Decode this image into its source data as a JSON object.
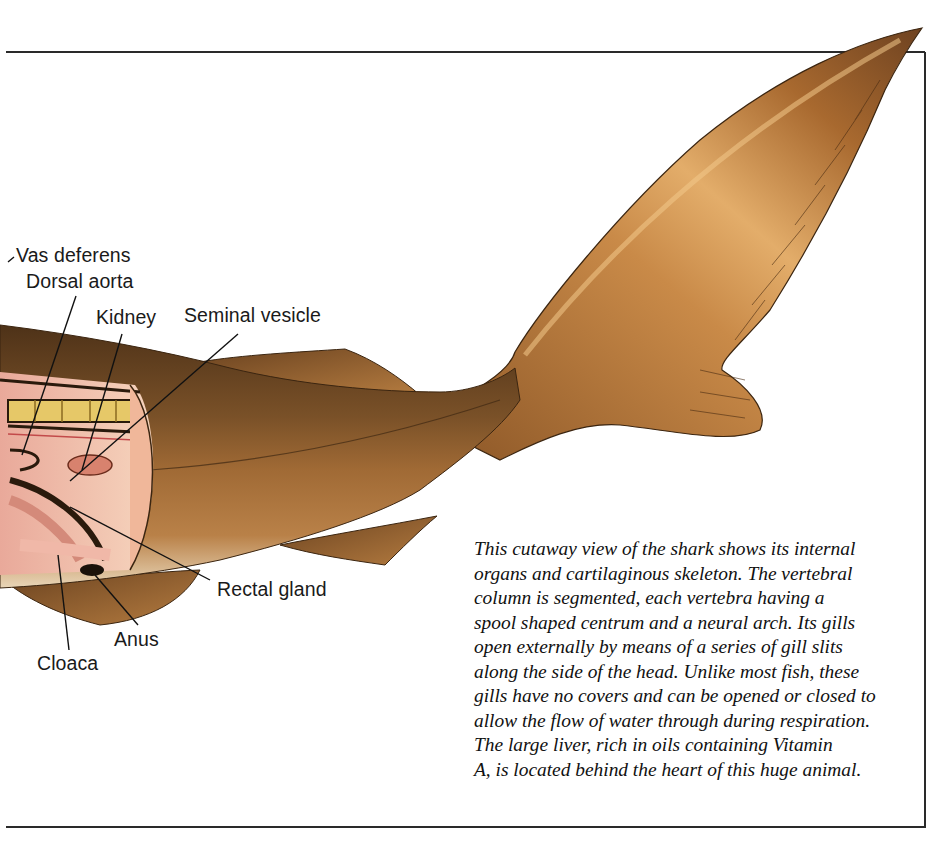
{
  "figure": {
    "colors": {
      "skin_dark": "#5a3a1c",
      "skin_mid": "#8a5a2c",
      "skin_light": "#c08a4a",
      "flesh": "#f1c7b0",
      "vertebra": "#e6c868",
      "frame": "#2a2a2a"
    }
  },
  "labels": [
    {
      "id": "vas-deferens",
      "text": "Vas deferens"
    },
    {
      "id": "dorsal-aorta",
      "text": "Dorsal aorta"
    },
    {
      "id": "kidney",
      "text": "Kidney"
    },
    {
      "id": "seminal-vesicle",
      "text": "Seminal vesicle"
    },
    {
      "id": "rectal-gland",
      "text": "Rectal gland"
    },
    {
      "id": "anus",
      "text": "Anus"
    },
    {
      "id": "cloaca",
      "text": "Cloaca"
    }
  ],
  "caption": {
    "lines": [
      "This cutaway view of the shark shows its internal",
      "organs and cartilaginous skeleton. The vertebral",
      "column is segmented, each vertebra having a",
      "spool shaped centrum and a neural arch. Its gills",
      "open externally by means of a series of gill slits",
      "along the side of the head. Unlike most fish, these",
      "gills have no covers and can be opened or closed to",
      "allow the flow of water through during respiration.",
      "The large liver, rich in oils containing Vitamin",
      "A, is located behind the heart of this huge animal."
    ]
  }
}
